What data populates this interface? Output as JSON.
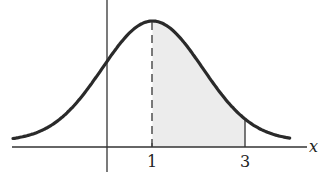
{
  "chart_data": {
    "type": "line",
    "title": "",
    "xlabel": "x",
    "ylabel": "",
    "x_ticks": [
      {
        "value": 1,
        "label": "1"
      },
      {
        "value": 3,
        "label": "3"
      }
    ],
    "curve": {
      "shape": "normal",
      "mean": 1,
      "sd_approx": 1.08,
      "peak_x": 1
    },
    "shaded_region": {
      "from": 1,
      "to": 3,
      "color": "#ececec"
    },
    "dashed_line_at": 1,
    "solid_line_at": 3,
    "xlim": [
      -2,
      4.5
    ],
    "grid": false,
    "legend": null
  },
  "labels": {
    "x_axis": "x",
    "tick_1": "1",
    "tick_3": "3"
  },
  "colors": {
    "curve": "#2a2a2a",
    "axis": "#333333",
    "shade": "#ececec"
  }
}
